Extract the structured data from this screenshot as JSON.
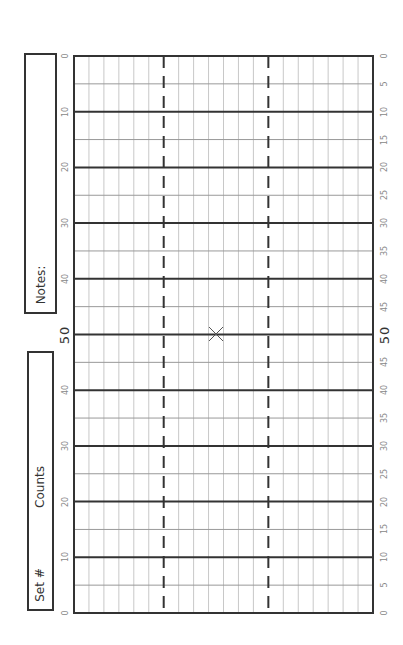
{
  "notes_box": {
    "label": "Notes:"
  },
  "set_box": {
    "set_label": "Set #",
    "counts_label": "Counts"
  },
  "field": {
    "left_yard_labels": [
      "0",
      "10",
      "20",
      "30",
      "40",
      "50",
      "40",
      "30",
      "20",
      "10",
      "0"
    ],
    "right_yard_labels": [
      "0",
      "5",
      "10",
      "15",
      "20",
      "25",
      "30",
      "35",
      "40",
      "45",
      "50",
      "45",
      "40",
      "35",
      "30",
      "25",
      "20",
      "15",
      "10",
      "5",
      "0"
    ],
    "columns": 20,
    "dashed_columns": [
      6,
      13
    ],
    "marker": {
      "symbol": "X",
      "yard_line_index": 10,
      "column": 9.5
    }
  },
  "colors": {
    "bold_line": "#333333",
    "thin_line": "#c8c8c8",
    "border": "#333333",
    "label": "#888888"
  }
}
